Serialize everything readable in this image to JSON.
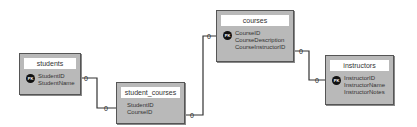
{
  "pk_label": "PK",
  "cardinality_label": "0",
  "tables": {
    "students": {
      "name": "students",
      "fields": [
        "StudentID",
        "StudentName"
      ]
    },
    "student_courses": {
      "name": "student_courses",
      "fields": [
        "StudentID",
        "CourseID"
      ]
    },
    "courses": {
      "name": "courses",
      "fields": [
        "CourseID",
        "CourseDescription",
        "CourseInstructorID"
      ]
    },
    "instructors": {
      "name": "instructors",
      "fields": [
        "InstructorID",
        "InstructorName",
        "InstructorNotes"
      ]
    }
  },
  "relationships": [
    {
      "from": "students.StudentID",
      "to": "student_courses.StudentID",
      "from_card": "0",
      "to_card": "0"
    },
    {
      "from": "student_courses.CourseID",
      "to": "courses.CourseID",
      "from_card": "0",
      "to_card": "0"
    },
    {
      "from": "courses.CourseInstructorID",
      "to": "instructors.InstructorID",
      "from_card": "0",
      "to_card": "0"
    }
  ]
}
